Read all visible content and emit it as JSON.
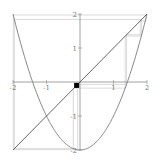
{
  "chart_data": {
    "type": "line",
    "title": "",
    "xlabel": "",
    "ylabel": "",
    "xlim": [
      -2,
      2
    ],
    "ylim": [
      -2,
      2
    ],
    "x_ticks": [
      -2,
      -1,
      1,
      2
    ],
    "x_tick_labels": [
      "-2",
      "-1",
      "1",
      "2"
    ],
    "y_ticks": [
      -2,
      -1,
      1,
      2
    ],
    "y_tick_labels": [
      "-2",
      "-1",
      "1",
      "2"
    ],
    "grid": false,
    "series": [
      {
        "name": "f(x) = x^2 - 2",
        "kind": "function",
        "color": "#777777"
      },
      {
        "name": "y = x",
        "kind": "identity",
        "color": "#555555"
      }
    ],
    "cobweb": {
      "start": -0.1,
      "iterates": [
        -0.2,
        -1.96,
        1.84,
        1.39,
        -0.07,
        -1.99,
        1.97,
        1.8,
        1.35,
        -0.18
      ],
      "color": "#cccccc"
    },
    "marker": {
      "x": -0.1,
      "y": -0.1,
      "color": "#000000"
    }
  }
}
